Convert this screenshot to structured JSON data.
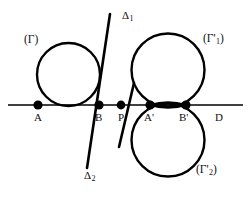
{
  "figure": {
    "background_color": "#ffffff",
    "stroke_color": "#000000",
    "width": 249,
    "height": 203
  },
  "axis": {
    "name": "D",
    "label": "D",
    "y": 105,
    "x_start": 8,
    "x_end": 243,
    "label_x": 216,
    "label_y": 112
  },
  "points": [
    {
      "id": "A",
      "label": "A",
      "x": 38,
      "y": 105,
      "label_x": 34,
      "label_y": 111,
      "radius": 4.6
    },
    {
      "id": "B",
      "label": "B",
      "x": 99,
      "y": 105,
      "label_x": 95,
      "label_y": 111,
      "radius": 4.6
    },
    {
      "id": "P",
      "label": "P",
      "x": 121,
      "y": 105,
      "label_x": 118,
      "label_y": 111,
      "radius": 4.4
    },
    {
      "id": "Ap",
      "label": "A'",
      "x": 150,
      "y": 105,
      "label_x": 144,
      "label_y": 111,
      "radius": 4.6
    },
    {
      "id": "Bp",
      "label": "B'",
      "x": 186,
      "y": 105,
      "label_x": 180,
      "label_y": 111,
      "radius": 4.6
    }
  ],
  "circles": [
    {
      "id": "gamma",
      "label": "(Γ)",
      "cx": 68.5,
      "cy": 74.5,
      "r": 31.5,
      "label_x": 24,
      "label_y": 40
    },
    {
      "id": "gamma-prime-1",
      "label": "(Γ'",
      "sub": "1",
      "label_close": ")",
      "cx": 168,
      "cy": 70,
      "r": 36.5,
      "label_x": 203,
      "label_y": 39
    },
    {
      "id": "gamma-prime-2",
      "label": "(Γ'",
      "sub": "2",
      "label_close": ")",
      "cx": 168,
      "cy": 140,
      "r": 36.5,
      "label_x": 196,
      "label_y": 170
    }
  ],
  "lens": {
    "id": "intersection-lens",
    "note": "lens formed where the two right circles meet between A' and B'",
    "x_left": 150,
    "x_right": 186,
    "y": 105,
    "bulge": 5.5
  },
  "lines": [
    {
      "id": "delta-1",
      "label": "Δ",
      "sub": "1",
      "x1": 110,
      "y1": 14,
      "x2": 87,
      "y2": 168,
      "label_x": 122,
      "label_y": 15
    },
    {
      "id": "delta-2",
      "label": "Δ",
      "sub": "2",
      "x1": 134,
      "y1": 83,
      "x2": 119,
      "y2": 147,
      "label_x": 84,
      "label_y": 174
    }
  ]
}
